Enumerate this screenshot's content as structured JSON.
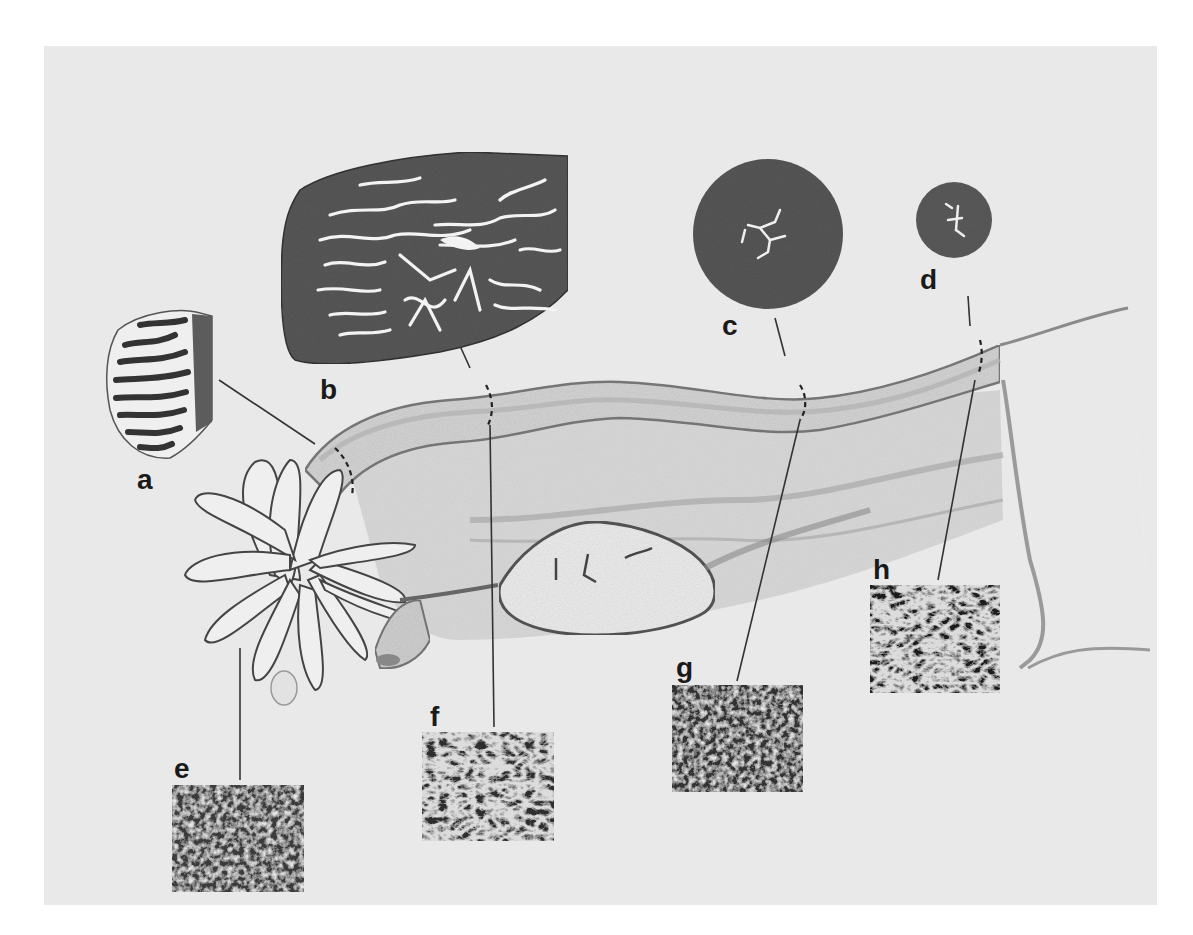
{
  "figure": {
    "background_color": "#e9e9e9",
    "labels": [
      {
        "id": "a",
        "text": "a",
        "type": "cross-section",
        "region": "infundibulum"
      },
      {
        "id": "b",
        "text": "b",
        "type": "cross-section",
        "region": "ampulla"
      },
      {
        "id": "c",
        "text": "c",
        "type": "cross-section",
        "region": "isthmus"
      },
      {
        "id": "d",
        "text": "d",
        "type": "cross-section",
        "region": "intramural (uterotubal junction)"
      },
      {
        "id": "e",
        "text": "e",
        "type": "SEM-inset",
        "region": "fimbriae"
      },
      {
        "id": "f",
        "text": "f",
        "type": "SEM-inset",
        "region": "ampulla"
      },
      {
        "id": "g",
        "text": "g",
        "type": "SEM-inset",
        "region": "isthmus"
      },
      {
        "id": "h",
        "text": "h",
        "type": "SEM-inset",
        "region": "intramural"
      }
    ],
    "colors": {
      "ink": "#1a1a1a",
      "tissue_dark": "#3c3c3c",
      "tissue_mid": "#6a6a6a",
      "lumen": "#f2f2f2",
      "drawing_shade": "#a8a8a8"
    }
  }
}
